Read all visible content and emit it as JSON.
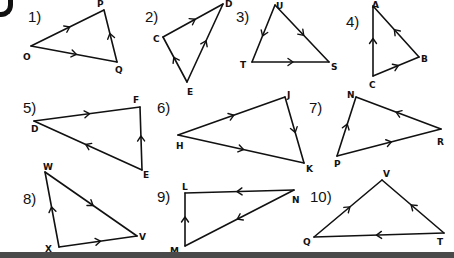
{
  "worksheet": {
    "corner_glyph": "D",
    "problems": [
      {
        "number": "1)",
        "num_pos": [
          28,
          8
        ],
        "vertices": [
          {
            "name": "O",
            "x": 31,
            "y": 46,
            "lx": 23,
            "ly": 60
          },
          {
            "name": "P",
            "x": 104,
            "y": 10,
            "lx": 97,
            "ly": 7
          },
          {
            "name": "Q",
            "x": 117,
            "y": 62,
            "lx": 115,
            "ly": 73
          }
        ],
        "edges": [
          {
            "from": "O",
            "to": "P"
          },
          {
            "from": "O",
            "to": "Q"
          },
          {
            "from": "Q",
            "to": "P"
          }
        ]
      },
      {
        "number": "2)",
        "num_pos": [
          145,
          8
        ],
        "vertices": [
          {
            "name": "C",
            "x": 163,
            "y": 37,
            "lx": 153,
            "ly": 42
          },
          {
            "name": "D",
            "x": 223,
            "y": 4,
            "lx": 225,
            "ly": 7
          },
          {
            "name": "E",
            "x": 187,
            "y": 82,
            "lx": 187,
            "ly": 95
          }
        ],
        "edges": [
          {
            "from": "C",
            "to": "D"
          },
          {
            "from": "E",
            "to": "C"
          },
          {
            "from": "E",
            "to": "D"
          }
        ]
      },
      {
        "number": "3)",
        "num_pos": [
          236,
          8
        ],
        "vertices": [
          {
            "name": "U",
            "x": 275,
            "y": 5,
            "lx": 276,
            "ly": 9
          },
          {
            "name": "T",
            "x": 252,
            "y": 62,
            "lx": 240,
            "ly": 68
          },
          {
            "name": "S",
            "x": 329,
            "y": 62,
            "lx": 331,
            "ly": 70
          }
        ],
        "edges": [
          {
            "from": "U",
            "to": "T"
          },
          {
            "from": "U",
            "to": "S"
          },
          {
            "from": "T",
            "to": "S"
          }
        ]
      },
      {
        "number": "4)",
        "num_pos": [
          346,
          13
        ],
        "vertices": [
          {
            "name": "A",
            "x": 373,
            "y": 6,
            "lx": 372,
            "ly": 8
          },
          {
            "name": "B",
            "x": 419,
            "y": 57,
            "lx": 421,
            "ly": 62
          },
          {
            "name": "C",
            "x": 373,
            "y": 76,
            "lx": 369,
            "ly": 88
          }
        ],
        "edges": [
          {
            "from": "B",
            "to": "A"
          },
          {
            "from": "C",
            "to": "A"
          },
          {
            "from": "C",
            "to": "B"
          }
        ]
      },
      {
        "number": "5)",
        "num_pos": [
          23,
          99
        ],
        "vertices": [
          {
            "name": "D",
            "x": 34,
            "y": 121,
            "lx": 31,
            "ly": 132
          },
          {
            "name": "F",
            "x": 140,
            "y": 107,
            "lx": 133,
            "ly": 103
          },
          {
            "name": "E",
            "x": 142,
            "y": 170,
            "lx": 143,
            "ly": 178
          }
        ],
        "edges": [
          {
            "from": "D",
            "to": "F"
          },
          {
            "from": "E",
            "to": "D"
          },
          {
            "from": "E",
            "to": "F"
          }
        ]
      },
      {
        "number": "6)",
        "num_pos": [
          157,
          99
        ],
        "vertices": [
          {
            "name": "H",
            "x": 178,
            "y": 135,
            "lx": 176,
            "ly": 149
          },
          {
            "name": "J",
            "x": 285,
            "y": 97,
            "lx": 287,
            "ly": 98
          },
          {
            "name": "K",
            "x": 304,
            "y": 163,
            "lx": 306,
            "ly": 172
          }
        ],
        "edges": [
          {
            "from": "H",
            "to": "J"
          },
          {
            "from": "H",
            "to": "K"
          },
          {
            "from": "J",
            "to": "K"
          }
        ]
      },
      {
        "number": "7)",
        "num_pos": [
          309,
          99
        ],
        "vertices": [
          {
            "name": "N",
            "x": 356,
            "y": 97,
            "lx": 347,
            "ly": 98
          },
          {
            "name": "R",
            "x": 441,
            "y": 129,
            "lx": 437,
            "ly": 145
          },
          {
            "name": "P",
            "x": 337,
            "y": 156,
            "lx": 334,
            "ly": 167
          }
        ],
        "edges": [
          {
            "from": "P",
            "to": "N"
          },
          {
            "from": "R",
            "to": "N"
          },
          {
            "from": "P",
            "to": "R"
          }
        ]
      },
      {
        "number": "8)",
        "num_pos": [
          23,
          190
        ],
        "vertices": [
          {
            "name": "W",
            "x": 45,
            "y": 172,
            "lx": 43,
            "ly": 170
          },
          {
            "name": "V",
            "x": 137,
            "y": 236,
            "lx": 139,
            "ly": 240
          },
          {
            "name": "X",
            "x": 59,
            "y": 247,
            "lx": 45,
            "ly": 252
          }
        ],
        "edges": [
          {
            "from": "W",
            "to": "V"
          },
          {
            "from": "X",
            "to": "W"
          },
          {
            "from": "X",
            "to": "V"
          }
        ]
      },
      {
        "number": "9)",
        "num_pos": [
          157,
          188
        ],
        "vertices": [
          {
            "name": "L",
            "x": 185,
            "y": 193,
            "lx": 182,
            "ly": 190
          },
          {
            "name": "N",
            "x": 294,
            "y": 190,
            "lx": 292,
            "ly": 203
          },
          {
            "name": "M",
            "x": 185,
            "y": 246,
            "lx": 170,
            "ly": 254
          }
        ],
        "edges": [
          {
            "from": "N",
            "to": "L"
          },
          {
            "from": "N",
            "to": "M"
          },
          {
            "from": "M",
            "to": "L"
          }
        ]
      },
      {
        "number": "10)",
        "num_pos": [
          310,
          188
        ],
        "vertices": [
          {
            "name": "V",
            "x": 382,
            "y": 180,
            "lx": 383,
            "ly": 177
          },
          {
            "name": "T",
            "x": 444,
            "y": 233,
            "lx": 437,
            "ly": 245
          },
          {
            "name": "Q",
            "x": 314,
            "y": 237,
            "lx": 303,
            "ly": 245
          }
        ],
        "edges": [
          {
            "from": "Q",
            "to": "V"
          },
          {
            "from": "T",
            "to": "V"
          },
          {
            "from": "T",
            "to": "Q"
          }
        ]
      }
    ]
  },
  "colors": {
    "ink": "#111111",
    "background": "#ffffff",
    "bottom_bar": "#4a4a4a"
  }
}
